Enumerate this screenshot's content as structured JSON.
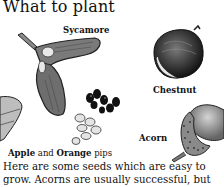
{
  "page": {
    "title": "What to plant",
    "labels": {
      "sycamore": "Sycamore",
      "chestnut": "Chestnut",
      "acorn": "Acorn",
      "apple": "Apple",
      "and": " and ",
      "orange": "Orange",
      "pips": " pips"
    },
    "body_lines": [
      "Here are some seeds which are easy to",
      "grow. Acorns are usually successful, but"
    ]
  },
  "illustrations": [
    {
      "name": "sycamore-seed-icon"
    },
    {
      "name": "chestnut-icon"
    },
    {
      "name": "acorn-icon"
    },
    {
      "name": "apple-pips-icon"
    },
    {
      "name": "orange-pips-icon"
    },
    {
      "name": "leaf-fragment-icon"
    }
  ]
}
